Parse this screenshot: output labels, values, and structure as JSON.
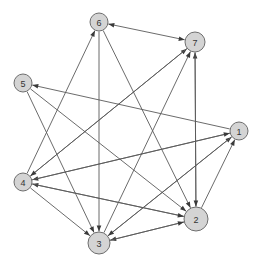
{
  "diagram": {
    "type": "directed-graph",
    "width": 263,
    "height": 269,
    "background_color": "#ffffff",
    "node_fill_color": "#d4d4d4",
    "node_stroke_color": "#6e6e6e",
    "edge_color": "#5a5a5a",
    "arrow_color": "#3a3a3a",
    "label_color": "#333333"
  },
  "nodes": [
    {
      "id": "1",
      "label": "1",
      "cx": 239,
      "cy": 131,
      "r": 9
    },
    {
      "id": "2",
      "label": "2",
      "cx": 196,
      "cy": 219,
      "r": 12
    },
    {
      "id": "3",
      "label": "3",
      "cx": 99,
      "cy": 243,
      "r": 11
    },
    {
      "id": "4",
      "label": "4",
      "cx": 23,
      "cy": 182,
      "r": 9
    },
    {
      "id": "5",
      "label": "5",
      "cx": 23,
      "cy": 83,
      "r": 9
    },
    {
      "id": "6",
      "label": "6",
      "cx": 99,
      "cy": 22,
      "r": 9
    },
    {
      "id": "7",
      "label": "7",
      "cx": 195,
      "cy": 42,
      "r": 10
    }
  ],
  "edges": [
    {
      "from": "6",
      "to": "7",
      "bidirectional": true
    },
    {
      "from": "4",
      "to": "6",
      "bidirectional": false
    },
    {
      "from": "6",
      "to": "3",
      "bidirectional": false
    },
    {
      "from": "6",
      "to": "2",
      "bidirectional": false
    },
    {
      "from": "3",
      "to": "7",
      "bidirectional": false
    },
    {
      "from": "4",
      "to": "7",
      "bidirectional": false
    },
    {
      "from": "2",
      "to": "7",
      "bidirectional": false
    },
    {
      "from": "1",
      "to": "5",
      "bidirectional": false
    },
    {
      "from": "5",
      "to": "2",
      "bidirectional": false
    },
    {
      "from": "5",
      "to": "3",
      "bidirectional": false
    },
    {
      "from": "7",
      "to": "4",
      "bidirectional": false
    },
    {
      "from": "1",
      "to": "4",
      "bidirectional": false
    },
    {
      "from": "2",
      "to": "4",
      "bidirectional": false
    },
    {
      "from": "4",
      "to": "1",
      "bidirectional": false
    },
    {
      "from": "3",
      "to": "1",
      "bidirectional": false
    },
    {
      "from": "2",
      "to": "1",
      "bidirectional": false
    },
    {
      "from": "4",
      "to": "3",
      "bidirectional": false
    },
    {
      "from": "4",
      "to": "2",
      "bidirectional": false
    },
    {
      "from": "1",
      "to": "3",
      "bidirectional": false
    },
    {
      "from": "2",
      "to": "3",
      "bidirectional": false
    },
    {
      "from": "3",
      "to": "2",
      "bidirectional": false
    },
    {
      "from": "7",
      "to": "2",
      "bidirectional": false
    }
  ]
}
